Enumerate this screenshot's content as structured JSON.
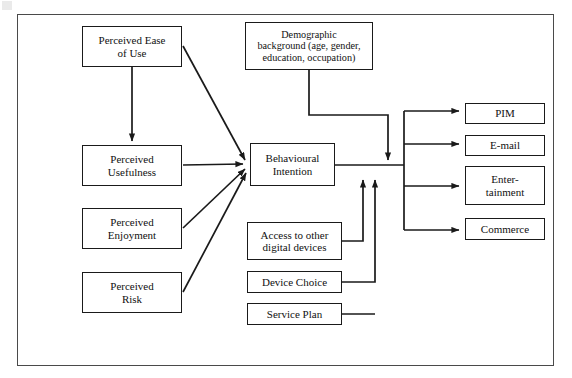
{
  "diagram": {
    "frame": {
      "name": "outer-border"
    },
    "style": {
      "line_color": "#1a1a1a",
      "box_fill": "#ffffff",
      "text_color": "#111111",
      "frame_color": "#4a4a4a"
    },
    "nodes": [
      {
        "id": "ease",
        "label": "Perceived Ease\nof Use",
        "x": 82,
        "y": 26,
        "w": 100,
        "h": 41
      },
      {
        "id": "demographic",
        "label": "Demographic\nbackground (age, gender,\neducation, occupation)",
        "x": 245,
        "y": 22,
        "w": 128,
        "h": 48
      },
      {
        "id": "usefulness",
        "label": "Perceived\nUsefulness",
        "x": 82,
        "y": 145,
        "w": 100,
        "h": 41
      },
      {
        "id": "intention",
        "label": "Behavioural\nIntention",
        "x": 250,
        "y": 143,
        "w": 85,
        "h": 43
      },
      {
        "id": "enjoyment",
        "label": "Perceived\nEnjoyment",
        "x": 82,
        "y": 208,
        "w": 100,
        "h": 41
      },
      {
        "id": "risk",
        "label": "Perceived\nRisk",
        "x": 82,
        "y": 272,
        "w": 100,
        "h": 41
      },
      {
        "id": "access",
        "label": "Access to other\ndigital devices",
        "x": 247,
        "y": 222,
        "w": 95,
        "h": 38
      },
      {
        "id": "device",
        "label": "Device Choice",
        "x": 247,
        "y": 271,
        "w": 95,
        "h": 22
      },
      {
        "id": "service",
        "label": "Service Plan",
        "x": 247,
        "y": 303,
        "w": 95,
        "h": 22
      },
      {
        "id": "pim",
        "label": "PIM",
        "x": 465,
        "y": 103,
        "w": 80,
        "h": 21
      },
      {
        "id": "email",
        "label": "E-mail",
        "x": 465,
        "y": 135,
        "w": 80,
        "h": 21
      },
      {
        "id": "entertain",
        "label": "Enter-\ntainment",
        "x": 465,
        "y": 166,
        "w": 80,
        "h": 39
      },
      {
        "id": "commerce",
        "label": "Commerce",
        "x": 465,
        "y": 218,
        "w": 80,
        "h": 22
      }
    ],
    "edges": [
      {
        "from": "ease",
        "to": "usefulness",
        "type": "arrow-down"
      },
      {
        "from": "ease",
        "to": "intention",
        "type": "arrow-diagonal"
      },
      {
        "from": "usefulness",
        "to": "intention",
        "type": "arrow-horizontal"
      },
      {
        "from": "enjoyment",
        "to": "intention",
        "type": "arrow-diagonal"
      },
      {
        "from": "risk",
        "to": "intention",
        "type": "arrow-diagonal"
      },
      {
        "from": "demographic",
        "to": "intention-output",
        "type": "arrow-down-elbow"
      },
      {
        "from": "access",
        "to": "intention-output",
        "type": "arrow-up-elbow"
      },
      {
        "from": "device",
        "to": "intention-output",
        "type": "arrow-up-elbow"
      },
      {
        "from": "service",
        "to": "intention-output",
        "type": "arrow-up-elbow"
      },
      {
        "from": "intention",
        "to": "pim",
        "type": "arrow-bus"
      },
      {
        "from": "intention",
        "to": "email",
        "type": "arrow-bus"
      },
      {
        "from": "intention",
        "to": "entertain",
        "type": "arrow-bus"
      },
      {
        "from": "intention",
        "to": "commerce",
        "type": "arrow-bus"
      }
    ]
  }
}
